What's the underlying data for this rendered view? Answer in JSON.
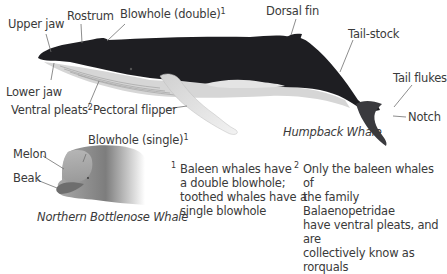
{
  "humpback": {
    "caption": "Humpback Whale",
    "labels": {
      "upper_jaw": "Upper jaw",
      "rostrum": "Rostrum",
      "blowhole_double": "Blowhole (double)",
      "blowhole_double_ref": "1",
      "dorsal_fin": "Dorsal fin",
      "tail_stock": "Tail-stock",
      "tail_flukes": "Tail flukes",
      "notch": "Notch",
      "lower_jaw": "Lower jaw",
      "ventral_pleats": "Ventral pleats",
      "ventral_pleats_ref": "2",
      "pectoral_flipper": "Pectoral flipper"
    }
  },
  "bottlenose": {
    "caption": "Northern Bottlenose Whale",
    "labels": {
      "melon": "Melon",
      "beak": "Beak",
      "blowhole_single": "Blowhole (single)",
      "blowhole_single_ref": "1"
    }
  },
  "footnotes": [
    {
      "ref": "1",
      "lines": [
        "Baleen whales have",
        "a double blowhole;",
        "toothed whales have a",
        "single blowhole"
      ]
    },
    {
      "ref": "2",
      "lines": [
        "Only the baleen whales of",
        "the family Balaenopetridae",
        "have ventral pleats, and are",
        "collectively know as rorquals"
      ]
    }
  ],
  "colors": {
    "body_dark": "#1e1e22",
    "belly_light": "#d8d8d8",
    "flipper": "#e2e2e2",
    "leader_line": "#707070",
    "bottlenose_gray": "#8a8a8a"
  }
}
